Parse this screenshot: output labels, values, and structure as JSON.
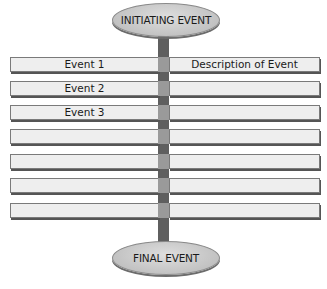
{
  "diagram": {
    "title_top": "INITIATING EVENT",
    "title_bottom": "FINAL EVENT",
    "rows": [
      {
        "left": "Event 1",
        "right": "Description of Event"
      },
      {
        "left": "Event 2",
        "right": ""
      },
      {
        "left": "Event 3",
        "right": ""
      },
      {
        "left": "",
        "right": ""
      },
      {
        "left": "",
        "right": ""
      },
      {
        "left": "",
        "right": ""
      },
      {
        "left": "",
        "right": ""
      }
    ],
    "colors": {
      "pole": "#5f5f5f",
      "crossing": "#9a9a9a",
      "cell_fill": "#eeeeee",
      "ellipse_fill": "#c8c8c8"
    }
  }
}
